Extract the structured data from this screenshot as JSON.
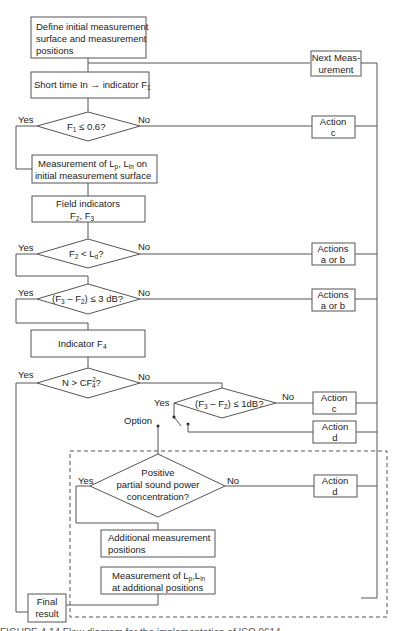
{
  "figure": {
    "type": "flowchart",
    "colors": {
      "line": "#555555",
      "text": "#222222",
      "background": "#ffffff"
    },
    "nodes": {
      "define": {
        "line1": "Define initial measurement",
        "line2": "surface and measurement",
        "line3": "positions"
      },
      "next_measurement": {
        "line1": "Next Meas-",
        "line2": "urement"
      },
      "short_time": {
        "label": "Short time In → indicator F",
        "sub": "1"
      },
      "decision_f1": {
        "pre": "F",
        "sub": "1",
        "post": " ≤ 0.6?",
        "yes": "Yes",
        "no": "No"
      },
      "action_c1": {
        "line1": "Action",
        "line2": "c"
      },
      "measure_lp": {
        "line1_a": "Measurement of L",
        "line1_sub1": "p",
        "line1_b": ", L",
        "line1_sub2": "in",
        "line1_c": " on",
        "line2": "initial measurement surface"
      },
      "field_indicators": {
        "line1": "Field indicators",
        "line2_a": "F",
        "line2_sub1": "2",
        "line2_b": ", F",
        "line2_sub2": "3"
      },
      "decision_f2": {
        "pre": "F",
        "sub1": "2",
        "mid": " < L",
        "sub2": "d",
        "post": "?",
        "yes": "Yes",
        "no": "No"
      },
      "actions_ab1": {
        "line1": "Actions",
        "line2": "a or b"
      },
      "decision_f3f2_3db": {
        "a": "(F",
        "sub1": "3",
        "b": " – F",
        "sub2": "2",
        "c": ") ≤ 3 dB?",
        "yes": "Yes",
        "no": "No"
      },
      "actions_ab2": {
        "line1": "Actions",
        "line2": "a or b"
      },
      "indicator_f4": {
        "pre": "Indicator F",
        "sub": "4"
      },
      "decision_n": {
        "pre": "N  > CF",
        "sup": "2",
        "sub": "4",
        "post": "?",
        "yes": "Yes",
        "no": "No"
      },
      "decision_f3f2_1db": {
        "a": "(F",
        "sub1": "3",
        "b": " – F",
        "sub2": "2",
        "c": ") ≤ 1dB?",
        "yes": "Yes",
        "no": "No"
      },
      "action_c2": {
        "line1": "Action",
        "line2": "c"
      },
      "action_d1": {
        "line1": "Action",
        "line2": "d"
      },
      "option_label": "Option",
      "decision_positive": {
        "line1": "Positive",
        "line2": "partial sound power",
        "line3": "concentration?",
        "yes": "Yes",
        "no": "No"
      },
      "action_d2": {
        "line1": "Action",
        "line2": "d"
      },
      "additional_positions": {
        "line1": "Additional measurement",
        "line2": "positions"
      },
      "measure_additional": {
        "line1_a": "Measurement of L",
        "line1_sub1": "p",
        "line1_b": ",L",
        "line1_sub2": "in",
        "line2": "at additional  positions"
      },
      "final_result": {
        "line1": "Final",
        "line2": "result"
      }
    },
    "caption_partial": "FIGURE 4.14  Flow diagram for the implementation of ISO 9614"
  }
}
